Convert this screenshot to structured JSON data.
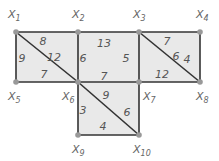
{
  "nodes": [
    {
      "id": "X1",
      "main": "X",
      "sub": "1",
      "x": 16,
      "y": 32,
      "lx": 8,
      "ly": 18
    },
    {
      "id": "X2",
      "main": "X",
      "sub": "2",
      "x": 78,
      "y": 32,
      "lx": 72,
      "ly": 18
    },
    {
      "id": "X3",
      "main": "X",
      "sub": "3",
      "x": 139,
      "y": 32,
      "lx": 133,
      "ly": 18
    },
    {
      "id": "X4",
      "main": "X",
      "sub": "4",
      "x": 200,
      "y": 32,
      "lx": 196,
      "ly": 18
    },
    {
      "id": "X5",
      "main": "X",
      "sub": "5",
      "x": 16,
      "y": 82,
      "lx": 8,
      "ly": 100
    },
    {
      "id": "X6",
      "main": "X",
      "sub": "6",
      "x": 78,
      "y": 82,
      "lx": 62,
      "ly": 100
    },
    {
      "id": "X7",
      "main": "X",
      "sub": "7",
      "x": 139,
      "y": 82,
      "lx": 143,
      "ly": 100
    },
    {
      "id": "X8",
      "main": "X",
      "sub": "8",
      "x": 200,
      "y": 82,
      "lx": 196,
      "ly": 100
    },
    {
      "id": "X9",
      "main": "X",
      "sub": "9",
      "x": 78,
      "y": 135,
      "lx": 72,
      "ly": 153
    },
    {
      "id": "X10",
      "main": "X",
      "sub": "10",
      "x": 139,
      "y": 135,
      "lx": 133,
      "ly": 153
    }
  ],
  "edges": [
    {
      "from": "X1",
      "to": "X2",
      "weight": "8",
      "lx": 43,
      "ly": 45
    },
    {
      "from": "X1",
      "to": "X5",
      "weight": "9",
      "lx": 22,
      "ly": 62
    },
    {
      "from": "X1",
      "to": "X6",
      "weight": "12",
      "lx": 54,
      "ly": 61
    },
    {
      "from": "X5",
      "to": "X6",
      "weight": "7",
      "lx": 44,
      "ly": 78
    },
    {
      "from": "X2",
      "to": "X3",
      "weight": "13",
      "lx": 104,
      "ly": 47
    },
    {
      "from": "X2",
      "to": "X6",
      "weight": "6",
      "lx": 83,
      "ly": 62
    },
    {
      "from": "X3",
      "to": "X7",
      "weight": "5",
      "lx": 126,
      "ly": 62
    },
    {
      "from": "X6",
      "to": "X7",
      "weight": "7",
      "lx": 104,
      "ly": 80
    },
    {
      "from": "X3",
      "to": "X4",
      "weight": "7",
      "lx": 167,
      "ly": 45
    },
    {
      "from": "X3",
      "to": "X8",
      "weight": "6",
      "lx": 176,
      "ly": 60
    },
    {
      "from": "X4",
      "to": "X8",
      "weight": "4",
      "lx": 187,
      "ly": 63
    },
    {
      "from": "X7",
      "to": "X8",
      "weight": "12",
      "lx": 162,
      "ly": 78
    },
    {
      "from": "X6",
      "to": "X9",
      "weight": "3",
      "lx": 83,
      "ly": 114
    },
    {
      "from": "X6",
      "to": "X10",
      "weight": "9",
      "lx": 106,
      "ly": 99
    },
    {
      "from": "X7",
      "to": "X10",
      "weight": "6",
      "lx": 127,
      "ly": 116
    },
    {
      "from": "X9",
      "to": "X10",
      "weight": "4",
      "lx": 103,
      "ly": 130
    }
  ],
  "faces": [
    {
      "points": "16,32 78,32 78,82 16,82"
    },
    {
      "points": "78,32 139,32 139,82 78,82"
    },
    {
      "points": "139,32 200,32 200,82 139,82"
    },
    {
      "points": "78,82 139,82 139,135 78,135"
    }
  ],
  "colors": {
    "fill": "#e9e9e9",
    "edge": "#333333",
    "node": "#999999"
  }
}
